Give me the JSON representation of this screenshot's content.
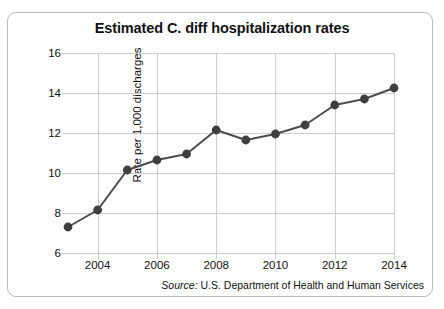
{
  "chart_data": {
    "type": "line",
    "title": "Estimated C. diff hospitalization rates",
    "xlabel": "",
    "ylabel": "Rate per 1,000 discharges",
    "x": [
      2003,
      2004,
      2005,
      2006,
      2007,
      2008,
      2009,
      2010,
      2011,
      2012,
      2013,
      2014
    ],
    "values": [
      7.3,
      8.15,
      10.15,
      10.65,
      10.95,
      12.15,
      11.65,
      11.95,
      12.4,
      13.4,
      13.7,
      14.25
    ],
    "series": [
      {
        "name": "Estimated C. diff hospitalization rate",
        "values": [
          7.3,
          8.15,
          10.15,
          10.65,
          10.95,
          12.15,
          11.65,
          11.95,
          12.4,
          13.4,
          13.7,
          14.25
        ]
      }
    ],
    "xlim": [
      2003,
      2014
    ],
    "ylim": [
      6,
      16
    ],
    "ytick_labels": [
      "6",
      "8",
      "10",
      "12",
      "14",
      "16"
    ],
    "yticks": [
      6,
      8,
      10,
      12,
      14,
      16
    ],
    "xtick_labels": [
      "2004",
      "2006",
      "2008",
      "2010",
      "2012",
      "2014"
    ],
    "xticks": [
      2004,
      2006,
      2008,
      2010,
      2012,
      2014
    ],
    "grid": true,
    "legend": "none",
    "line_color": "#4d4d4d",
    "marker_color": "#3f3f3f",
    "grid_color": "#cfcfcf",
    "marker": "circle"
  },
  "source": {
    "prefix": "Source:",
    "text": "U.S. Department of Health and Human Services"
  }
}
